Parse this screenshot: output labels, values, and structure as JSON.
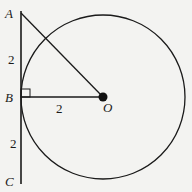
{
  "diagram": {
    "type": "geometry",
    "points": {
      "A": {
        "label": "A",
        "x": 21,
        "y": 13
      },
      "B": {
        "label": "B",
        "x": 21,
        "y": 97
      },
      "C": {
        "label": "C",
        "x": 21,
        "y": 181
      },
      "O": {
        "label": "O",
        "x": 103,
        "y": 97
      }
    },
    "circle": {
      "center": "O",
      "radius_px": 82
    },
    "segment_labels": {
      "AB": "2",
      "BO": "2",
      "BC": "2"
    },
    "right_angle_at": "B",
    "colors": {
      "ink": "#1a1a1a",
      "background": "#f3f3f1"
    }
  }
}
